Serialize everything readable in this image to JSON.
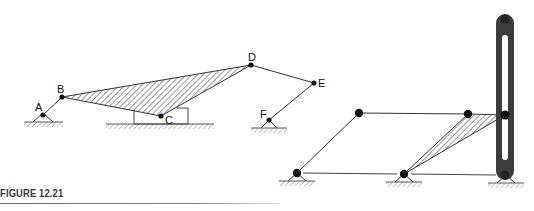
{
  "figure": {
    "caption": "FIGURE 12.21"
  },
  "left_mechanism": {
    "joints": [
      {
        "id": "A",
        "label": "A"
      },
      {
        "id": "B",
        "label": "B"
      },
      {
        "id": "C",
        "label": "C"
      },
      {
        "id": "D",
        "label": "D"
      },
      {
        "id": "E",
        "label": "E"
      },
      {
        "id": "F",
        "label": "F"
      }
    ],
    "links": [
      "A-B",
      "B-C-D (hatched ternary link)",
      "D-E",
      "E-F"
    ],
    "ground_pivots": [
      "A",
      "F"
    ],
    "slider": "C on horizontal ground block"
  },
  "right_mechanism": {
    "description": "Parallelogram linkage with hatched coupler and slotted vertical bar",
    "ground_pivots": 3,
    "moving_joints": 3
  },
  "colors": {
    "line": "#333333",
    "joint": "#111111",
    "slotted_bar": "#3c3c3c",
    "hatch": "#444444"
  }
}
